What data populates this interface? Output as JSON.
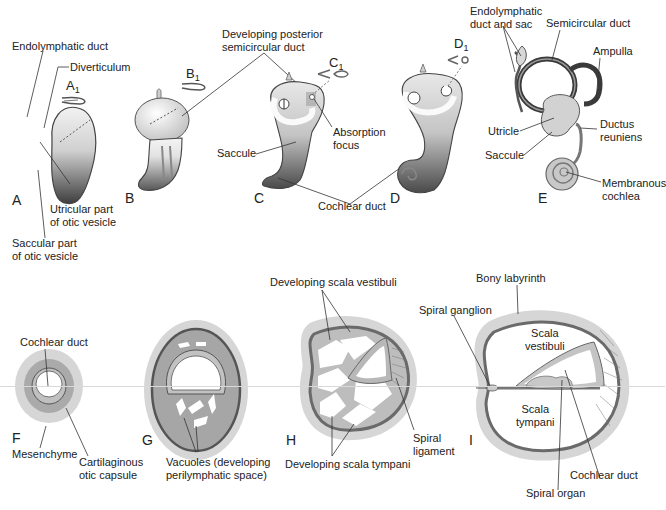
{
  "figure": {
    "colors": {
      "background": "#ffffff",
      "mesenchyme": "#d6d6d6",
      "capsule": "#a9a9a9",
      "capsule_border": "#6e6e6e",
      "duct_fill": "#bdbdbd",
      "dark_vesicle": "#5a5a5a",
      "light_vesicle": "#efefef",
      "leader_line": "#333333"
    },
    "top_row": {
      "panels": [
        {
          "id": "A",
          "letter": "A",
          "subfigure": {
            "base": "A",
            "sub": "1"
          },
          "labels": [
            "Endolymphatic duct",
            "Diverticulum",
            "Utricular part\nof otic vesicle",
            "Saccular part\nof otic vesicle"
          ]
        },
        {
          "id": "B",
          "letter": "B",
          "subfigure": {
            "base": "B",
            "sub": "1"
          },
          "labels": []
        },
        {
          "id": "C",
          "letter": "C",
          "subfigure": {
            "base": "C",
            "sub": "1"
          },
          "labels": [
            "Developing posterior\nsemicircular duct",
            "Absorption\nfocus",
            "Saccule"
          ]
        },
        {
          "id": "D",
          "letter": "D",
          "subfigure": {
            "base": "D",
            "sub": "1"
          },
          "labels": []
        },
        {
          "id": "E",
          "letter": "E",
          "labels": [
            "Endolymphatic\nduct and sac",
            "Semicircular duct",
            "Ampulla",
            "Utricle",
            "Ductus\nreuniens",
            "Saccule",
            "Membranous\ncochlea"
          ]
        }
      ],
      "shared_labels": {
        "cochlear_duct": "Cochlear duct"
      }
    },
    "bottom_row": {
      "panels": [
        {
          "id": "F",
          "letter": "F",
          "labels": [
            "Cochlear duct",
            "Mesenchyme",
            "Cartilaginous\notic capsule"
          ]
        },
        {
          "id": "G",
          "letter": "G",
          "labels": [
            "Vacuoles (developing\nperilymphatic space)"
          ]
        },
        {
          "id": "H",
          "letter": "H",
          "labels": [
            "Developing scala vestibuli",
            "Spiral\nligament",
            "Developing scala tympani"
          ]
        },
        {
          "id": "I",
          "letter": "I",
          "labels": [
            "Bony labyrinth",
            "Spiral ganglion",
            "Scala\nvestibuli",
            "Scala\ntympani",
            "Cochlear duct",
            "Spiral organ"
          ]
        }
      ]
    }
  }
}
